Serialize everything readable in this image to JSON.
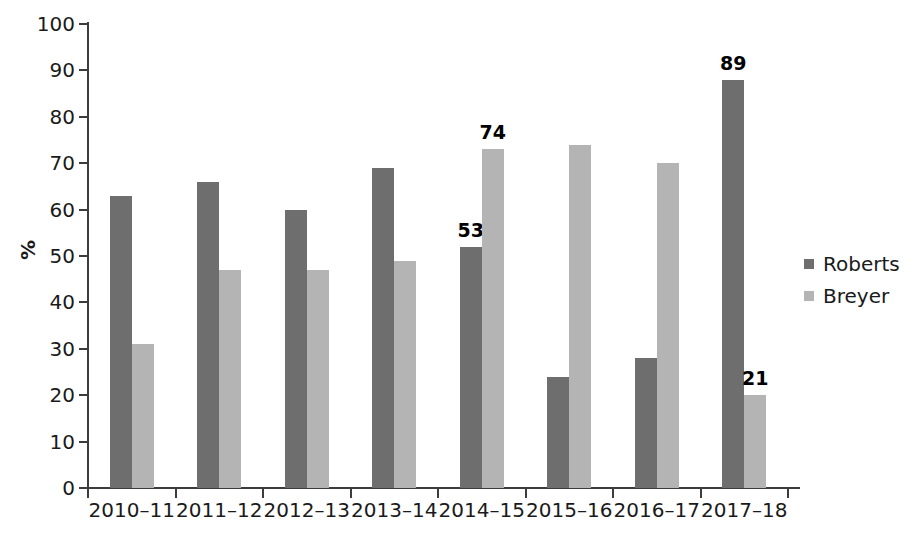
{
  "chart_data": {
    "type": "bar",
    "title": "",
    "subtitle": "",
    "xlabel": "",
    "ylabel": "%",
    "ylim": [
      0,
      100
    ],
    "ytick_step": 10,
    "ytick_labels": [
      "100",
      "90",
      "80",
      "70",
      "60",
      "50",
      "40",
      "30",
      "20",
      "10",
      "0"
    ],
    "grid": false,
    "legend_position": "right",
    "categories": [
      "2010–11",
      "2011–12",
      "2012–13",
      "2013–14",
      "2014–15",
      "2015–16",
      "2016–17",
      "2017–18"
    ],
    "series": [
      {
        "name": "Roberts",
        "color": "#6e6e6e",
        "values": [
          63,
          66,
          60,
          69,
          52,
          24,
          28,
          88
        ],
        "data_labels": [
          "",
          "",
          "",
          "",
          "53",
          "",
          "",
          "89"
        ]
      },
      {
        "name": "Breyer",
        "color": "#b4b4b4",
        "values": [
          31,
          47,
          47,
          49,
          73,
          74,
          70,
          20
        ],
        "data_labels": [
          "",
          "",
          "",
          "",
          "74",
          "",
          "",
          "21"
        ]
      }
    ]
  },
  "legend": {
    "items": [
      {
        "label": "Roberts",
        "color": "#6e6e6e"
      },
      {
        "label": "Breyer",
        "color": "#b4b4b4"
      }
    ]
  },
  "colors": {
    "series_dark": "#6e6e6e",
    "series_light": "#b4b4b4",
    "axis": "#3c3c3c",
    "text": "#1a1a1a",
    "background": "#ffffff"
  }
}
